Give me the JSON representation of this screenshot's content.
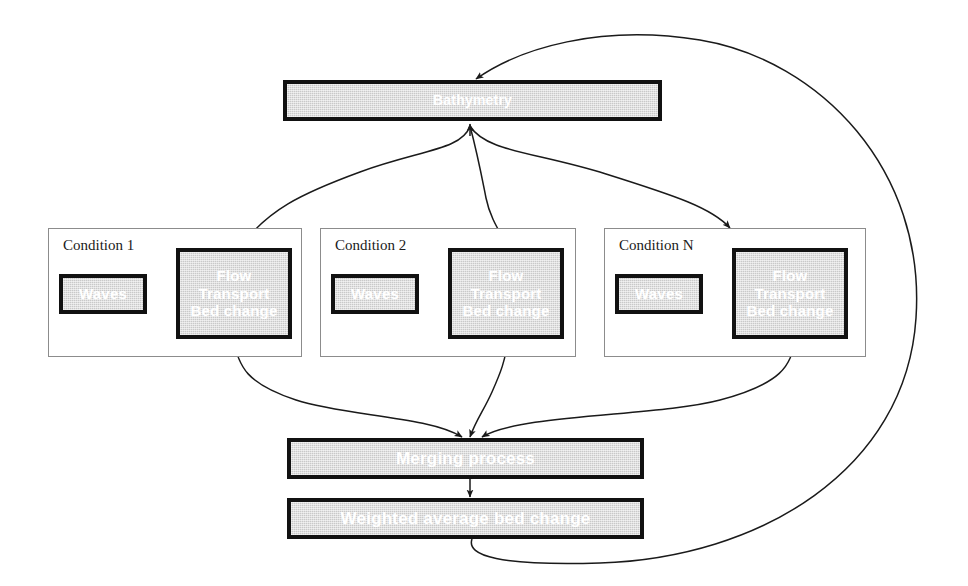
{
  "diagram": {
    "colors": {
      "box_fill": "#c9c9c9",
      "box_border": "#111111",
      "box_text": "#ffffff",
      "container_border": "#8c8c8c",
      "container_label_text": "#1a1a1a",
      "connector": "#1a1a1a",
      "background": "#ffffff"
    }
  },
  "nodes": {
    "bathymetry": {
      "label": "Bathymetry"
    },
    "merging": {
      "label": "Merging process"
    },
    "weighted": {
      "label": "Weighted average bed change"
    }
  },
  "conditions": [
    {
      "label": "Condition 1",
      "waves": {
        "label": "Waves"
      },
      "model": {
        "line1": "Flow",
        "line2": "Transport",
        "line3": "Bed change"
      }
    },
    {
      "label": "Condition 2",
      "waves": {
        "label": "Waves"
      },
      "model": {
        "line1": "Flow",
        "line2": "Transport",
        "line3": "Bed change"
      }
    },
    {
      "label": "Condition N",
      "waves": {
        "label": "Waves"
      },
      "model": {
        "line1": "Flow",
        "line2": "Transport",
        "line3": "Bed change"
      }
    }
  ],
  "connectors": [
    {
      "name": "bathymetry-to-condition-1",
      "from": "bathymetry",
      "to": "condition-1-model",
      "style": "curved-arrow"
    },
    {
      "name": "bathymetry-to-condition-2",
      "from": "bathymetry",
      "to": "condition-2-model",
      "style": "curved-arrow"
    },
    {
      "name": "bathymetry-to-condition-n",
      "from": "bathymetry",
      "to": "condition-n-model",
      "style": "curved-arrow"
    },
    {
      "name": "condition-1-to-merging",
      "from": "condition-1-model",
      "to": "merging",
      "style": "curved-arrow"
    },
    {
      "name": "condition-2-to-merging",
      "from": "condition-2-model",
      "to": "merging",
      "style": "curved-arrow"
    },
    {
      "name": "condition-n-to-merging",
      "from": "condition-n-model",
      "to": "merging",
      "style": "curved-arrow"
    },
    {
      "name": "merging-to-weighted",
      "from": "merging",
      "to": "weighted",
      "style": "straight-arrow"
    },
    {
      "name": "weighted-feedback-to-bathymetry",
      "from": "weighted",
      "to": "bathymetry",
      "style": "curved-feedback-loop"
    },
    {
      "name": "waves-model-exchange-1",
      "from": "condition-1-waves",
      "to": "condition-1-model",
      "style": "double-headed-arrow"
    },
    {
      "name": "waves-model-exchange-2",
      "from": "condition-2-waves",
      "to": "condition-2-model",
      "style": "double-headed-arrow"
    },
    {
      "name": "waves-model-exchange-n",
      "from": "condition-n-waves",
      "to": "condition-n-model",
      "style": "double-headed-arrow"
    }
  ]
}
